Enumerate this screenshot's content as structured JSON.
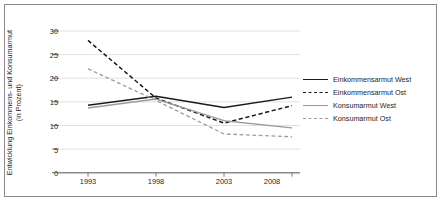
{
  "chart_data": {
    "type": "line",
    "title": "",
    "xlabel": "",
    "ylabel": "Entwicklung Einkommens- und Konsumarmut (in Prozent)",
    "ylabel_line1": "Entwicklung Einkommens- und Konsumarmut",
    "ylabel_line2": "(in Prozent)",
    "categories": [
      "1993",
      "1998",
      "2003",
      "2008"
    ],
    "x": [
      1993,
      1998,
      2003,
      2008
    ],
    "ylim": [
      0,
      30
    ],
    "yticks": [
      0,
      5,
      10,
      15,
      20,
      25,
      30
    ],
    "ytick_labels": [
      "0",
      "5",
      "10",
      "15",
      "20",
      "25",
      "30"
    ],
    "grid": "horizontal",
    "legend_position": "right",
    "series": [
      {
        "name": "Einkommensarmut West",
        "values": [
          14.3,
          16.2,
          13.8,
          16.0
        ],
        "color": "#1a1a1a",
        "style": "solid",
        "width": 1.5
      },
      {
        "name": "Einkommensarmut Ost",
        "values": [
          28.0,
          15.8,
          10.5,
          14.2
        ],
        "color": "#1a1a1a",
        "style": "dashed",
        "width": 1.5
      },
      {
        "name": "Konsumarmut West",
        "values": [
          13.7,
          15.6,
          11.0,
          9.5
        ],
        "color": "#9b9b9b",
        "style": "solid",
        "width": 1.3
      },
      {
        "name": "Konsumarmut Ost",
        "values": [
          22.0,
          15.3,
          8.2,
          7.6
        ],
        "color": "#9b9b9b",
        "style": "dashed",
        "width": 1.3
      }
    ],
    "axis_color": "#8c8c8c",
    "grid_color": "#d9d9d9",
    "frame_color": "#8a8a8a",
    "background": "#ffffff"
  },
  "legend": {
    "items": [
      {
        "label": "Einkommensarmut West"
      },
      {
        "label": "Einkommensarmut Ost"
      },
      {
        "label": "Konsumarmut West"
      },
      {
        "label": "Konsumarmut Ost"
      }
    ]
  }
}
